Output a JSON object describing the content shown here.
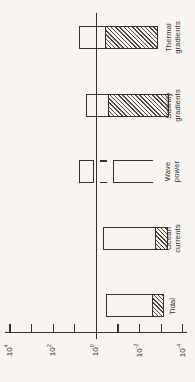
{
  "figure": {
    "background_color": "#f8f5f0",
    "ink_color": "#33312d",
    "title": ""
  },
  "chart_data": {
    "type": "bar",
    "subtype": "floating-range-bars",
    "scale": "log10",
    "rotated": true,
    "title": "",
    "xlabel": "",
    "ylabel": "",
    "axis": {
      "range_log10": [
        4,
        -4
      ],
      "tick_exponents": [
        4,
        3,
        2,
        1,
        0,
        -1,
        -2,
        -3,
        -4
      ],
      "tick_labels": [
        {
          "base": "10",
          "exp": "4",
          "log10": 4
        },
        {
          "base": "10",
          "exp": "2",
          "log10": 2
        },
        {
          "base": "10",
          "exp": "0",
          "log10": 0
        },
        {
          "base": "10",
          "exp": "-2",
          "log10": -2
        },
        {
          "base": "10",
          "exp": "-4",
          "log10": -4
        }
      ],
      "reference_line_log10": 0,
      "grid": false
    },
    "bars_top_to_bottom": [
      {
        "label": "Thermal gradients",
        "label_lines": [
          "Thermal",
          "gradients"
        ],
        "segments": [
          {
            "style": "open",
            "log10_range": [
              0.81,
              -0.44
            ],
            "approx_values": [
              6.5,
              0.36
            ]
          },
          {
            "style": "hatched",
            "log10_range": [
              -0.44,
              -2.86
            ],
            "approx_values": [
              0.36,
              0.0014
            ]
          }
        ]
      },
      {
        "label": "Salinity gradients",
        "label_lines": [
          "Salinity",
          "gradients"
        ],
        "segments": [
          {
            "style": "open",
            "log10_range": [
              0.49,
              -0.58
            ],
            "approx_values": [
              3.1,
              0.26
            ]
          },
          {
            "style": "hatched",
            "log10_range": [
              -0.58,
              -3.37
            ],
            "approx_values": [
              0.26,
              0.00043
            ]
          }
        ]
      },
      {
        "label": "Wave power",
        "label_lines": [
          "Wave",
          "power"
        ],
        "segments": [
          {
            "style": "open",
            "log10_range": [
              0.81,
              0.12
            ],
            "approx_values": [
              6.5,
              1.3
            ]
          },
          {
            "style": "dash-break",
            "log10_range": [
              0.12,
              -0.77
            ],
            "approx_values": [
              1.3,
              0.17
            ]
          },
          {
            "style": "open",
            "log10_range": [
              -0.77,
              -2.63
            ],
            "approx_values": [
              0.17,
              0.0023
            ],
            "open_right_end": true
          }
        ]
      },
      {
        "label": "Ocean currents",
        "label_lines": [
          "Ocean",
          "currents"
        ],
        "segments": [
          {
            "style": "open",
            "log10_range": [
              -0.3,
              -2.77
            ],
            "approx_values": [
              0.5,
              0.0017
            ]
          },
          {
            "style": "hatched",
            "log10_range": [
              -2.77,
              -3.33
            ],
            "approx_values": [
              0.0017,
              0.00047
            ]
          }
        ]
      },
      {
        "label": "Tidal",
        "label_lines": [
          "Tidal"
        ],
        "segments": [
          {
            "style": "open",
            "log10_range": [
              -0.44,
              -2.63
            ],
            "approx_values": [
              0.36,
              0.0023
            ]
          },
          {
            "style": "hatched",
            "log10_range": [
              -2.63,
              -3.14
            ],
            "approx_values": [
              0.0023,
              0.00072
            ]
          }
        ]
      }
    ]
  }
}
